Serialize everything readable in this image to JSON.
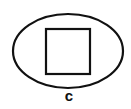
{
  "diagram": {
    "ellipse": {
      "cx": 68,
      "cy": 51,
      "rx": 55,
      "ry": 37,
      "stroke": "#111111",
      "stroke_width": 2.2
    },
    "square": {
      "x": 46,
      "y": 29,
      "width": 44,
      "height": 45,
      "stroke": "#111111",
      "stroke_width": 2.2
    },
    "label": "c"
  }
}
